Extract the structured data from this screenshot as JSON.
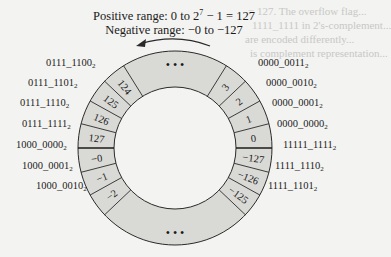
{
  "title": {
    "positive_prefix": "Positive range: 0 to 2",
    "positive_exp": "7",
    "positive_suffix": " − 1 = 127",
    "negative": "Negative range: −0 to −127"
  },
  "ring": {
    "top_ellipsis": "• • •",
    "bottom_ellipsis": "• • •",
    "left_cells": [
      "124",
      "125",
      "126",
      "127",
      "−0",
      "−1",
      "−2"
    ],
    "right_cells": [
      "3",
      "2",
      "1",
      "0",
      "−127",
      "−126",
      "−125"
    ]
  },
  "labels": {
    "left": [
      "0111_1100",
      "0111_1101",
      "0111_1110",
      "0111_1111",
      "1000_0000",
      "1000_0001",
      "1000_0010"
    ],
    "right": [
      "0000_0011",
      "0000_0010",
      "0000_0001",
      "0000_0000",
      "11111_1111",
      "1111_1110",
      "1111_1101"
    ],
    "subscript": "2"
  },
  "colors": {
    "ring_fill": "#d9d9d6",
    "stroke": "#2a2a2a",
    "background": "#f3f3f1"
  },
  "background_text": [
    "= 127. The overflow flag...",
    "1111_1111 in 2's-complement...",
    "are encoded differently...",
    "is complement representation..."
  ]
}
